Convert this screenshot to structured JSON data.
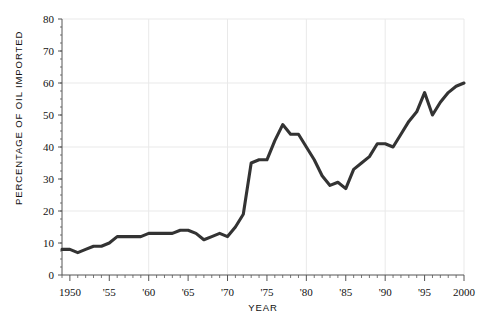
{
  "chart_data": {
    "type": "line",
    "title": "",
    "xlabel": "YEAR",
    "ylabel": "PERCENTAGE OF OIL IMPORTED",
    "xlim": [
      1949,
      2000
    ],
    "ylim": [
      0,
      80
    ],
    "grid": true,
    "legend": "none",
    "line_color": "#333333",
    "grid_color": "#e9e9e9",
    "axis_color": "#555555",
    "y_ticks": [
      0,
      10,
      20,
      30,
      40,
      50,
      60,
      70,
      80
    ],
    "y_tick_labels": [
      "0",
      "10",
      "20",
      "30",
      "40",
      "50",
      "60",
      "70",
      "80"
    ],
    "y_gridlines": [
      20,
      40,
      60,
      80
    ],
    "x_ticks": [
      1950,
      1955,
      1960,
      1965,
      1970,
      1975,
      1980,
      1985,
      1990,
      1995,
      2000
    ],
    "x_tick_labels": [
      "1950",
      "'55",
      "'60",
      "'65",
      "'70",
      "'75",
      "'80",
      "'85",
      "'90",
      "'95",
      "2000"
    ],
    "x_gridlines": [
      1960,
      1970,
      1980,
      1990,
      2000
    ],
    "x_minor_tick_step": 1,
    "x": [
      1949,
      1950,
      1951,
      1952,
      1953,
      1954,
      1955,
      1956,
      1957,
      1958,
      1959,
      1960,
      1961,
      1962,
      1963,
      1964,
      1965,
      1966,
      1967,
      1968,
      1969,
      1970,
      1971,
      1972,
      1973,
      1974,
      1975,
      1976,
      1977,
      1978,
      1979,
      1980,
      1981,
      1982,
      1983,
      1984,
      1985,
      1986,
      1987,
      1988,
      1989,
      1990,
      1991,
      1992,
      1993,
      1994,
      1995,
      1996,
      1997,
      1998,
      1999,
      2000
    ],
    "values": [
      8,
      8,
      7,
      8,
      9,
      9,
      10,
      12,
      12,
      12,
      12,
      13,
      13,
      13,
      13,
      14,
      14,
      13,
      11,
      12,
      13,
      12,
      15,
      19,
      35,
      36,
      36,
      42,
      47,
      44,
      44,
      40,
      36,
      31,
      28,
      29,
      27,
      33,
      35,
      37,
      41,
      41,
      40,
      44,
      48,
      51,
      57,
      50,
      54,
      57,
      59,
      60
    ]
  },
  "geometry": {
    "plot_left": 62,
    "plot_right": 464,
    "plot_top": 19,
    "plot_bottom": 275
  }
}
